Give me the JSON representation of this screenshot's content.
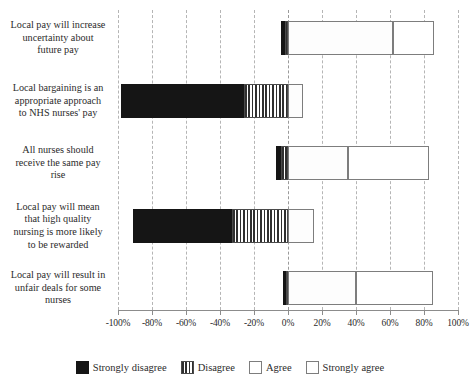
{
  "chart_data": {
    "type": "bar",
    "orientation": "horizontal",
    "stacked": true,
    "diverging": true,
    "title": "",
    "subtitle": "",
    "xlabel": "",
    "ylabel": "",
    "xlim": [
      -100,
      100
    ],
    "grid": true,
    "legend_position": "bottom",
    "xticks": [
      "-100%",
      "-80%",
      "-60%",
      "-40%",
      "-20%",
      "0%",
      "20%",
      "40%",
      "60%",
      "80%",
      "100%"
    ],
    "xtick_values": [
      -100,
      -80,
      -60,
      -40,
      -20,
      0,
      20,
      40,
      60,
      80,
      100
    ],
    "categories": [
      "Local pay will increase uncertainty about future pay",
      "Local bargaining is an appropriate approach to NHS nurses' pay",
      "All nurses should receive the same pay rise",
      "Local pay will mean that high quality nursing is more likely to be rewarded",
      "Local pay will result in unfair deals for some nurses"
    ],
    "category_lines": [
      [
        "Local pay will increase",
        "uncertainty about",
        "future pay"
      ],
      [
        "Local bargaining is an",
        "appropriate approach",
        "to NHS nurses' pay"
      ],
      [
        "All nurses should",
        "receive the same pay",
        "rise"
      ],
      [
        "Local pay will mean",
        "that high quality",
        "nursing is more likely",
        "to be rewarded"
      ],
      [
        "Local pay will result in",
        "unfair deals for some",
        "nurses"
      ]
    ],
    "series": [
      {
        "name": "Strongly disagree",
        "key": "sd",
        "color": "#151515",
        "pattern": "solid",
        "values": [
          -2,
          -72,
          -3,
          -58,
          -2
        ]
      },
      {
        "name": "Disagree",
        "key": "d",
        "color": "#2f2f2f",
        "pattern": "vertical-stripes",
        "values": [
          -2,
          -26,
          -4,
          -33,
          -1
        ]
      },
      {
        "name": "Agree",
        "key": "a",
        "color": "#ffffff",
        "pattern": "outline",
        "values": [
          62,
          9,
          35,
          15,
          40
        ]
      },
      {
        "name": "Strongly agree",
        "key": "sa",
        "color": "#ffffff",
        "pattern": "outline",
        "values": [
          24,
          0,
          48,
          0,
          45
        ]
      }
    ],
    "legend": [
      "Strongly disagree",
      "Disagree",
      "Agree",
      "Strongly agree"
    ]
  },
  "legend": {
    "items": [
      {
        "label": "Strongly disagree",
        "swatch": "sd"
      },
      {
        "label": "Disagree",
        "swatch": "d"
      },
      {
        "label": "Agree",
        "swatch": "a"
      },
      {
        "label": "Strongly agree",
        "swatch": "sa"
      }
    ]
  }
}
